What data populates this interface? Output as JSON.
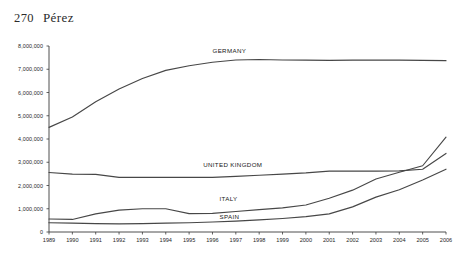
{
  "page": {
    "folio": "270",
    "running_head": "Pérez"
  },
  "chart_data": {
    "type": "line",
    "title": "",
    "subtitle": "",
    "xlabel": "",
    "ylabel": "",
    "grid": false,
    "legend_position": "inline-labels",
    "x": [
      1989,
      1990,
      1991,
      1992,
      1993,
      1994,
      1995,
      1996,
      1997,
      1998,
      1999,
      2000,
      2001,
      2002,
      2003,
      2004,
      2005,
      2006
    ],
    "xtick_labels": [
      "1989",
      "1990",
      "1991",
      "1992",
      "1993",
      "1994",
      "1995",
      "1996",
      "1997",
      "1998",
      "1999",
      "2000",
      "2001",
      "2002",
      "2003",
      "2004",
      "2005",
      "2006"
    ],
    "ytick_labels": [
      "0",
      "1,000,000",
      "2,000,000",
      "3,000,000",
      "4,000,000",
      "5,000,000",
      "6,000,000",
      "7,000,000",
      "8,000,000"
    ],
    "ytick_values": [
      0,
      1000000,
      2000000,
      3000000,
      4000000,
      5000000,
      6000000,
      7000000,
      8000000
    ],
    "xlim": [
      1989,
      2006
    ],
    "ylim": [
      0,
      8000000
    ],
    "series": [
      {
        "name": "GERMANY",
        "label": "GERMANY",
        "values": [
          4500000,
          4950000,
          5600000,
          6150000,
          6600000,
          6950000,
          7150000,
          7300000,
          7400000,
          7420000,
          7400000,
          7390000,
          7380000,
          7390000,
          7390000,
          7390000,
          7380000,
          7370000
        ]
      },
      {
        "name": "UNITED KINGDOM",
        "label": "UNITED KINGDOM",
        "values": [
          2560000,
          2490000,
          2480000,
          2350000,
          2350000,
          2350000,
          2350000,
          2350000,
          2390000,
          2440000,
          2490000,
          2540000,
          2620000,
          2620000,
          2620000,
          2630000,
          2700000,
          3380000
        ]
      },
      {
        "name": "ITALY",
        "label": "ITALY",
        "values": [
          560000,
          540000,
          780000,
          940000,
          1000000,
          1000000,
          790000,
          800000,
          880000,
          960000,
          1040000,
          1160000,
          1450000,
          1800000,
          2280000,
          2570000,
          2850000,
          4080000
        ]
      },
      {
        "name": "SPAIN",
        "label": "SPAIN",
        "values": [
          400000,
          380000,
          360000,
          350000,
          360000,
          380000,
          400000,
          430000,
          470000,
          520000,
          580000,
          660000,
          780000,
          1080000,
          1500000,
          1820000,
          2240000,
          2700000
        ]
      }
    ],
    "annotations": [
      {
        "text": "GERMANY",
        "x": 1996.0,
        "y": 7720000
      },
      {
        "text": "UNITED KINGDOM",
        "x": 1995.6,
        "y": 2810000
      },
      {
        "text": "ITALY",
        "x": 1996.3,
        "y": 1320000
      },
      {
        "text": "SPAIN",
        "x": 1996.3,
        "y": 560000
      }
    ]
  }
}
